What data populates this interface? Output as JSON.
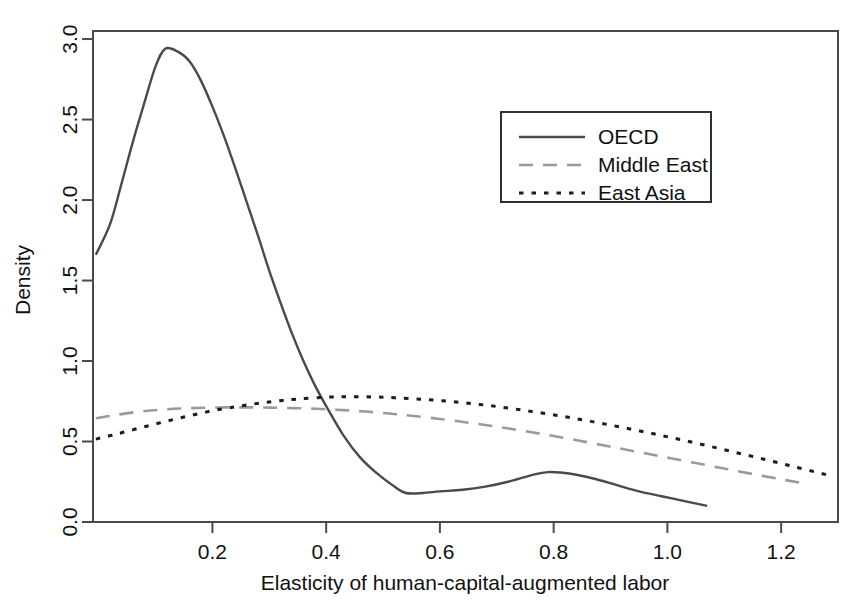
{
  "chart_data": {
    "type": "line",
    "title": "",
    "xlabel": "Elasticity of human-capital-augmented labor",
    "ylabel": "Density",
    "xlim": [
      -0.01,
      1.3
    ],
    "ylim": [
      0.0,
      3.05
    ],
    "grid": false,
    "legend_position": "top-right",
    "xticks": [
      0.2,
      0.4,
      0.6,
      0.8,
      1.0,
      1.2
    ],
    "xtick_labels": [
      "0.2",
      "0.4",
      "0.6",
      "0.8",
      "1.0",
      "1.2"
    ],
    "yticks": [
      0.0,
      0.5,
      1.0,
      1.5,
      2.0,
      2.5,
      3.0
    ],
    "ytick_labels": [
      "0.0",
      "0.5",
      "1.0",
      "1.5",
      "2.0",
      "2.5",
      "3.0"
    ],
    "series": [
      {
        "name": "OECD",
        "style": "solid",
        "color": "#4a4a4a",
        "width": 2.4,
        "x": [
          -0.005,
          0.02,
          0.04,
          0.06,
          0.08,
          0.1,
          0.117,
          0.14,
          0.16,
          0.18,
          0.2,
          0.22,
          0.24,
          0.26,
          0.28,
          0.3,
          0.32,
          0.34,
          0.36,
          0.38,
          0.4,
          0.43,
          0.46,
          0.49,
          0.52,
          0.54,
          0.57,
          0.6,
          0.64,
          0.68,
          0.72,
          0.76,
          0.79,
          0.83,
          0.87,
          0.91,
          0.95,
          0.99,
          1.03,
          1.07
        ],
        "y": [
          1.66,
          1.85,
          2.1,
          2.36,
          2.6,
          2.83,
          2.94,
          2.92,
          2.86,
          2.74,
          2.58,
          2.4,
          2.2,
          1.99,
          1.78,
          1.56,
          1.36,
          1.17,
          1.0,
          0.85,
          0.72,
          0.54,
          0.4,
          0.3,
          0.22,
          0.18,
          0.18,
          0.19,
          0.2,
          0.22,
          0.25,
          0.29,
          0.31,
          0.3,
          0.27,
          0.23,
          0.19,
          0.16,
          0.13,
          0.1
        ]
      },
      {
        "name": "Middle East",
        "style": "dashed",
        "color": "#9a9a9a",
        "width": 2.6,
        "x": [
          -0.005,
          0.03,
          0.07,
          0.11,
          0.15,
          0.19,
          0.23,
          0.27,
          0.31,
          0.35,
          0.39,
          0.43,
          0.47,
          0.51,
          0.55,
          0.6,
          0.65,
          0.7,
          0.75,
          0.8,
          0.85,
          0.9,
          0.95,
          1.0,
          1.05,
          1.1,
          1.15,
          1.2,
          1.24
        ],
        "y": [
          0.645,
          0.665,
          0.685,
          0.698,
          0.706,
          0.71,
          0.712,
          0.712,
          0.71,
          0.707,
          0.702,
          0.695,
          0.686,
          0.674,
          0.66,
          0.64,
          0.617,
          0.592,
          0.564,
          0.534,
          0.502,
          0.468,
          0.434,
          0.4,
          0.366,
          0.332,
          0.298,
          0.265,
          0.24
        ]
      },
      {
        "name": "East Asia",
        "style": "dotted",
        "color": "#1c1c1c",
        "width": 3.0,
        "x": [
          -0.005,
          0.03,
          0.07,
          0.11,
          0.15,
          0.19,
          0.23,
          0.27,
          0.31,
          0.35,
          0.4,
          0.44,
          0.48,
          0.52,
          0.57,
          0.62,
          0.67,
          0.72,
          0.77,
          0.82,
          0.87,
          0.92,
          0.97,
          1.02,
          1.07,
          1.12,
          1.17,
          1.22,
          1.27,
          1.29
        ],
        "y": [
          0.515,
          0.545,
          0.582,
          0.618,
          0.652,
          0.684,
          0.71,
          0.732,
          0.75,
          0.764,
          0.775,
          0.778,
          0.777,
          0.772,
          0.762,
          0.748,
          0.73,
          0.708,
          0.682,
          0.654,
          0.622,
          0.588,
          0.552,
          0.514,
          0.474,
          0.432,
          0.39,
          0.346,
          0.302,
          0.285
        ]
      }
    ]
  },
  "legend": {
    "items": [
      {
        "label": "OECD",
        "style": "solid"
      },
      {
        "label": "Middle East",
        "style": "dashed"
      },
      {
        "label": "East Asia",
        "style": "dotted"
      }
    ]
  },
  "axes": {
    "x_title": "Elasticity of human-capital-augmented labor",
    "y_title": "Density"
  }
}
